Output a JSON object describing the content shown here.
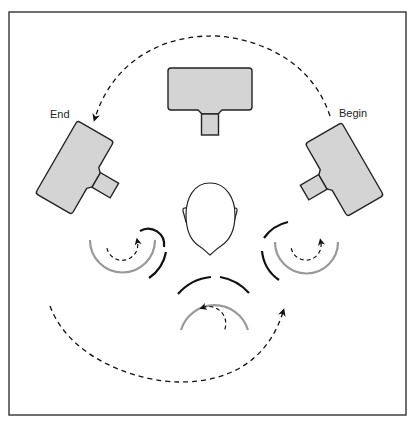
{
  "diagram": {
    "labels": {
      "begin": "Begin",
      "end": "End"
    },
    "colors": {
      "border": "#333333",
      "detector_fill": "#d4d4d4",
      "detector_stroke": "#222222",
      "outer_arc": "#111111",
      "gantry_arc": "#999999",
      "dashed_path": "#111111",
      "background": "#ffffff"
    },
    "elements": {
      "detectors": [
        {
          "position": "top",
          "rotation_deg": 0
        },
        {
          "position": "left",
          "rotation_deg": -60
        },
        {
          "position": "right",
          "rotation_deg": 60
        }
      ],
      "head": {
        "view": "top-down",
        "facing": "down"
      },
      "rotation_indicators": [
        {
          "position": "lower-left",
          "direction": "counterclockwise"
        },
        {
          "position": "bottom",
          "direction": "counterclockwise"
        },
        {
          "position": "lower-right",
          "direction": "counterclockwise"
        }
      ],
      "paths": [
        {
          "name": "upper-arc",
          "from": "Begin",
          "to": "End",
          "style": "dashed"
        },
        {
          "name": "lower-arc",
          "style": "dashed",
          "arrow": "upper-right"
        }
      ]
    }
  }
}
